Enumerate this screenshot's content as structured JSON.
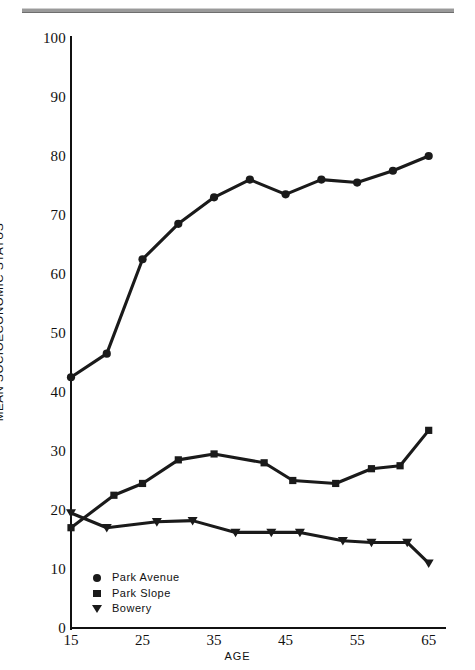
{
  "chart_data": {
    "type": "line",
    "title": "",
    "xlabel": "AGE",
    "ylabel": "MEAN SOCIOECONOMIC STATUS",
    "xlim": [
      15,
      67
    ],
    "ylim": [
      0,
      100
    ],
    "xticks": [
      15,
      25,
      35,
      45,
      55,
      65
    ],
    "yticks": [
      0,
      10,
      20,
      30,
      40,
      50,
      60,
      70,
      80,
      90,
      100
    ],
    "grid": false,
    "legend_position": "inside-lower-left",
    "series": [
      {
        "name": "Park Avenue",
        "marker": "circle",
        "color": "#1a1a1a",
        "x": [
          15,
          20,
          25,
          30,
          35,
          40,
          45,
          50,
          55,
          60,
          65
        ],
        "values": [
          42.5,
          46.5,
          62.5,
          68.5,
          73,
          76,
          73.5,
          76,
          75.5,
          77.5,
          80
        ]
      },
      {
        "name": "Park Slope",
        "marker": "square",
        "color": "#1a1a1a",
        "x": [
          15,
          21,
          25,
          30,
          35,
          42,
          46,
          52,
          57,
          61,
          65
        ],
        "values": [
          17,
          22.5,
          24.5,
          28.5,
          29.5,
          28,
          25,
          24.5,
          27,
          27.5,
          33.5
        ]
      },
      {
        "name": "Bowery",
        "marker": "triangle-down",
        "color": "#1a1a1a",
        "x": [
          15,
          20,
          27,
          32,
          38,
          43,
          47,
          53,
          57,
          62,
          65
        ],
        "values": [
          19.5,
          17,
          18,
          18.2,
          16.2,
          16.2,
          16.2,
          14.8,
          14.5,
          14.5,
          11
        ]
      }
    ]
  },
  "axes": {
    "y_tick_labels": [
      "100",
      "90",
      "80",
      "70",
      "60",
      "50",
      "40",
      "30",
      "20",
      "10",
      "0"
    ],
    "x_tick_labels": [
      "15",
      "25",
      "35",
      "45",
      "55",
      "65"
    ],
    "y_axis_title": "MEAN SOCIOECONOMIC STATUS",
    "x_axis_title": "AGE"
  },
  "legend": {
    "items": [
      {
        "label": "Park Avenue",
        "icon": "filled-circle-icon"
      },
      {
        "label": "Park Slope",
        "icon": "filled-square-icon"
      },
      {
        "label": "Bowery",
        "icon": "filled-triangle-down-icon"
      }
    ]
  }
}
